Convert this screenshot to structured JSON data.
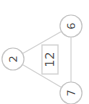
{
  "diagram": {
    "orientation_rotation_deg": -90,
    "nodes": [
      {
        "id": "top-right",
        "value": "6"
      },
      {
        "id": "left",
        "value": "2"
      },
      {
        "id": "bottom-right",
        "value": "7"
      }
    ],
    "center": {
      "value": "12"
    },
    "colors": {
      "stroke": "#c8c8c8",
      "text": "#555555",
      "background": "#ffffff"
    }
  }
}
